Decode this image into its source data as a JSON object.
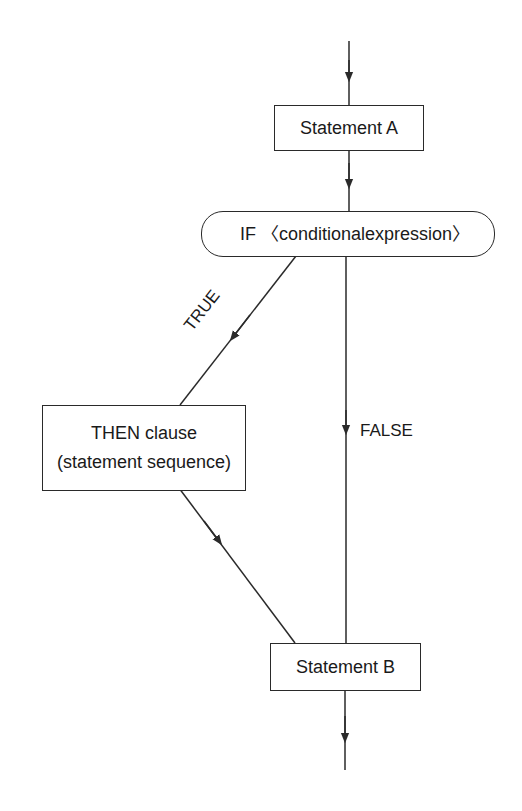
{
  "diagram": {
    "type": "flowchart",
    "nodes": {
      "statement_a": {
        "label": "Statement A"
      },
      "condition": {
        "label": "IF 〈conditionalexpression〉"
      },
      "then_clause": {
        "line1": "THEN clause",
        "line2": "(statement sequence)"
      },
      "statement_b": {
        "label": "Statement B"
      }
    },
    "edges": {
      "true_label": "TRUE",
      "false_label": "FALSE"
    },
    "colors": {
      "stroke": "#2a2a2a",
      "background": "#ffffff"
    }
  }
}
